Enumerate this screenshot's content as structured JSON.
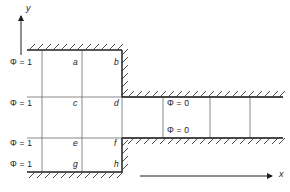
{
  "figure": {
    "type": "finite-difference-grid-diagram",
    "axes": {
      "x_label": "x",
      "y_label": "y"
    },
    "boundary_labels_left": [
      {
        "text": "Φ = 1",
        "x": 10,
        "y": 62
      },
      {
        "text": "Φ = 1",
        "x": 10,
        "y": 103
      },
      {
        "text": "Φ = 1",
        "x": 10,
        "y": 143
      },
      {
        "text": "Φ = 1",
        "x": 10,
        "y": 164
      }
    ],
    "boundary_labels_right": [
      {
        "text": "Φ = 0",
        "x": 167,
        "y": 103
      },
      {
        "text": "Φ = 0",
        "x": 167,
        "y": 130
      }
    ],
    "node_labels": [
      {
        "text": "a",
        "x": 74,
        "y": 62
      },
      {
        "text": "b",
        "x": 114,
        "y": 62
      },
      {
        "text": "c",
        "x": 74,
        "y": 103
      },
      {
        "text": "d",
        "x": 114,
        "y": 103
      },
      {
        "text": "e",
        "x": 74,
        "y": 143
      },
      {
        "text": "f",
        "x": 114,
        "y": 143
      },
      {
        "text": "g",
        "x": 74,
        "y": 164
      },
      {
        "text": "h",
        "x": 114,
        "y": 164
      }
    ],
    "colors": {
      "line": "#3a3a3a",
      "wall": "#1f1f1f",
      "text": "#1a1a1a",
      "background": "#ffffff"
    },
    "geometry": {
      "grid_x": [
        42,
        82,
        122
      ],
      "grid_y": [
        50,
        97,
        138,
        172
      ],
      "right_grid_x": [
        163,
        210,
        250
      ],
      "x_axis_y": 176,
      "x_axis_from": 140,
      "x_axis_to": 276,
      "y_axis_x": 21,
      "y_axis_from": 55,
      "y_axis_to": 14
    }
  }
}
